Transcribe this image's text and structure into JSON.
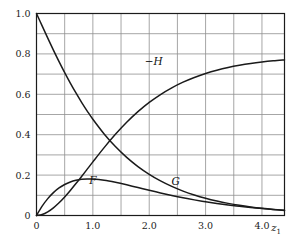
{
  "chart_data": {
    "type": "line",
    "title": "",
    "subtitle": "",
    "xlabel": "z1",
    "xlabel_base": "z",
    "xlabel_sub": "1",
    "ylabel": "",
    "xlim": [
      0,
      4.4
    ],
    "ylim": [
      0,
      1.0
    ],
    "grid": true,
    "grid_x_major_step": 0.5,
    "grid_y_major_step": 0.1,
    "legend_position": "inline-labels",
    "x_ticks": [
      {
        "value": 0,
        "label": "0"
      },
      {
        "value": 0.5,
        "label": ""
      },
      {
        "value": 1.0,
        "label": "1.0"
      },
      {
        "value": 1.5,
        "label": ""
      },
      {
        "value": 2.0,
        "label": "2.0"
      },
      {
        "value": 2.5,
        "label": ""
      },
      {
        "value": 3.0,
        "label": "3.0"
      },
      {
        "value": 3.5,
        "label": ""
      },
      {
        "value": 4.0,
        "label": "4.0"
      }
    ],
    "y_ticks": [
      {
        "value": 0.0,
        "label": "0"
      },
      {
        "value": 0.1,
        "label": ""
      },
      {
        "value": 0.2,
        "label": "0.2"
      },
      {
        "value": 0.3,
        "label": ""
      },
      {
        "value": 0.4,
        "label": "0.4"
      },
      {
        "value": 0.5,
        "label": ""
      },
      {
        "value": 0.6,
        "label": "0.6"
      },
      {
        "value": 0.7,
        "label": ""
      },
      {
        "value": 0.8,
        "label": "0.8"
      },
      {
        "value": 0.9,
        "label": ""
      },
      {
        "value": 1.0,
        "label": "1.0"
      }
    ],
    "x": [
      0,
      0.1,
      0.2,
      0.3,
      0.4,
      0.5,
      0.6,
      0.7,
      0.8,
      0.9,
      1.0,
      1.2,
      1.4,
      1.6,
      1.8,
      2.0,
      2.2,
      2.4,
      2.6,
      2.8,
      3.0,
      3.2,
      3.4,
      3.6,
      3.8,
      4.0,
      4.2,
      4.4
    ],
    "series": [
      {
        "name": "F",
        "label": "F",
        "color": "#1a1a1a",
        "values": [
          0.0,
          0.0462,
          0.0836,
          0.1133,
          0.1364,
          0.1536,
          0.166,
          0.1742,
          0.1789,
          0.1807,
          0.1802,
          0.1742,
          0.1641,
          0.1518,
          0.1385,
          0.1249,
          0.1117,
          0.0993,
          0.0878,
          0.0774,
          0.0681,
          0.0596,
          0.0521,
          0.0455,
          0.0396,
          0.0343,
          0.0298,
          0.0258
        ]
      },
      {
        "name": "G",
        "label": "G",
        "color": "#1a1a1a",
        "values": [
          1.0,
          0.9386,
          0.878,
          0.819,
          0.7621,
          0.7076,
          0.6557,
          0.6067,
          0.5605,
          0.5171,
          0.4766,
          0.4038,
          0.3411,
          0.2876,
          0.2422,
          0.2039,
          0.1714,
          0.144,
          0.1209,
          0.1015,
          0.0852,
          0.0715,
          0.06,
          0.0503,
          0.0422,
          0.0354,
          0.0297,
          0.0249
        ]
      },
      {
        "name": "-H",
        "label": "−H",
        "color": "#1a1a1a",
        "values": [
          0.0,
          0.0048,
          0.0179,
          0.0377,
          0.0628,
          0.0919,
          0.1239,
          0.158,
          0.1934,
          0.2294,
          0.2655,
          0.3361,
          0.4021,
          0.4616,
          0.5141,
          0.5598,
          0.5989,
          0.6321,
          0.6601,
          0.6835,
          0.703,
          0.7191,
          0.7324,
          0.7433,
          0.7522,
          0.7595,
          0.7655,
          0.7703
        ]
      }
    ],
    "annotations": [
      {
        "text": "−H",
        "x": 2.08,
        "y": 0.745,
        "name": "curve-label-minus-h"
      },
      {
        "text": "F",
        "x": 1.0,
        "y": 0.155,
        "name": "curve-label-f"
      },
      {
        "text": "G",
        "x": 2.47,
        "y": 0.15,
        "name": "curve-label-g"
      }
    ]
  },
  "axes": {
    "frame_color": "#1b1b1b",
    "grid_color": "#8f8f8f",
    "curve_color": "#1a1a1a",
    "background": "#ffffff"
  }
}
